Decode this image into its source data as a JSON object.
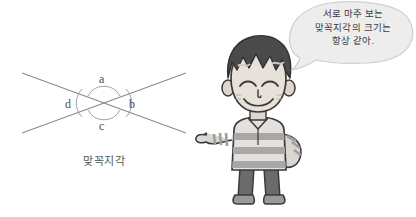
{
  "page": {
    "background_color": "#ffffff",
    "width": 416,
    "height": 217
  },
  "diagram": {
    "name": "vertical-angles-diagram",
    "caption": "맞꼭지각",
    "line_color": "#8a8a8a",
    "arc_color": "#9a9a9a",
    "label_color": "#4a4a4a",
    "labels": [
      {
        "id": "a",
        "text": "a",
        "position": "top"
      },
      {
        "id": "b",
        "text": "b",
        "position": "right"
      },
      {
        "id": "c",
        "text": "c",
        "position": "bottom"
      },
      {
        "id": "d",
        "text": "d",
        "position": "left"
      }
    ]
  },
  "speech_bubble": {
    "name": "speech-bubble",
    "fill_color": "#ededed",
    "stroke_color": "#cccccc",
    "text_color": "#3c3c3c",
    "lines": [
      "서로 마주 보는",
      "맞꼭지각의 크기는",
      "항상 같아."
    ],
    "full_text": "서로 마주 보는 맞꼭지각의 크기는 항상 같아."
  },
  "character": {
    "name": "cartoon-boy-character",
    "description": "스파이키 머리 소년",
    "hair_color": "#4a4a4a",
    "skin_color": "#e8e0d8",
    "shirt_light": "#e0ddd8",
    "shirt_dark": "#9e9e9e",
    "pants_color": "#6b6b6b",
    "shoe_color": "#8a8a8a",
    "outline_color": "#3a3a3a"
  }
}
